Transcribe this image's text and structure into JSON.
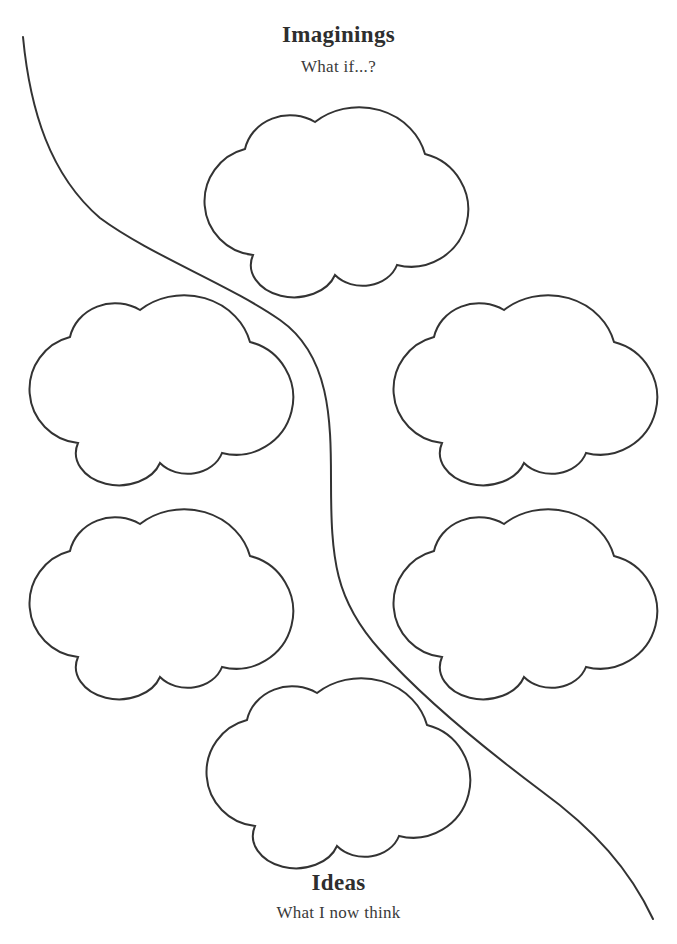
{
  "worksheet": {
    "top_section": {
      "title": "Imaginings",
      "subtitle": "What if...?"
    },
    "bottom_section": {
      "title": "Ideas",
      "subtitle": "What I now think"
    },
    "clouds": [
      {
        "id": "top",
        "x": 201,
        "y": 97
      },
      {
        "id": "middle-left",
        "x": 26,
        "y": 285
      },
      {
        "id": "middle-right",
        "x": 390,
        "y": 285
      },
      {
        "id": "lower-left",
        "x": 26,
        "y": 499
      },
      {
        "id": "lower-right",
        "x": 390,
        "y": 499
      },
      {
        "id": "bottom",
        "x": 203,
        "y": 668
      }
    ],
    "colors": {
      "line": "#333333",
      "text": "#2e2e2e",
      "background": "#ffffff"
    }
  }
}
